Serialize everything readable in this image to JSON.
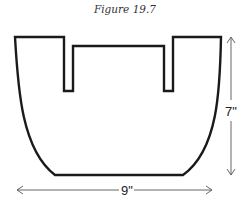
{
  "figure": {
    "title": "Figure 19.7"
  },
  "dimensions": {
    "height_label": "7\"",
    "width_label": "9\""
  },
  "colors": {
    "outline": "#1a1a1a",
    "dimension_line": "#555555",
    "background": "#ffffff"
  }
}
